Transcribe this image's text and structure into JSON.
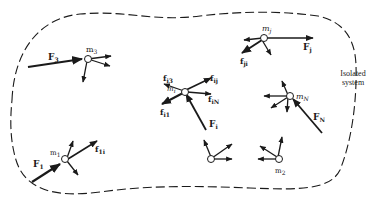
{
  "diagram": {
    "boundary": {
      "style": "dashed",
      "label_line1": "Isolated",
      "label_line2": "system"
    },
    "colors": {
      "ink": "#1a1a1a",
      "background": "#ffffff"
    },
    "particles": [
      {
        "id": "m3",
        "label": "m",
        "sub": "3",
        "external_force": {
          "label": "F",
          "sub": "3"
        }
      },
      {
        "id": "mj",
        "label": "m",
        "sub": "j",
        "external_force": {
          "label": "F",
          "sub": "j"
        },
        "internal_force": {
          "label": "f",
          "sub": "ji"
        }
      },
      {
        "id": "mi",
        "label": "m",
        "sub": "i",
        "external_force": {
          "label": "F",
          "sub": "i"
        },
        "internal_forces": [
          {
            "label": "f",
            "sub": "i3"
          },
          {
            "label": "f",
            "sub": "ij"
          },
          {
            "label": "f",
            "sub": "iN"
          },
          {
            "label": "f",
            "sub": "i1"
          }
        ]
      },
      {
        "id": "mN",
        "label": "m",
        "sub": "N",
        "external_force": {
          "label": "F",
          "sub": "N"
        }
      },
      {
        "id": "m1",
        "label": "m",
        "sub": "1",
        "external_force": {
          "label": "F",
          "sub": "1"
        },
        "internal_force": {
          "label": "f",
          "sub": "1i"
        }
      },
      {
        "id": "m2",
        "label": "m",
        "sub": "2"
      },
      {
        "id": "unlabeled",
        "label": "",
        "sub": ""
      }
    ]
  }
}
